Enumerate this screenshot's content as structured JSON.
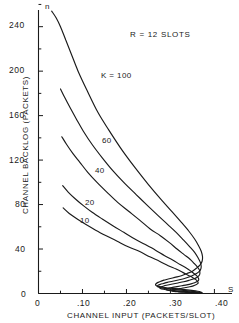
{
  "figure": {
    "background_color": "#ffffff",
    "ink_color": "#1a1a1a"
  },
  "annotation": {
    "text": "R = 12 SLOTS"
  },
  "axis_symbols": {
    "y_variable": "n",
    "x_variable": "S"
  },
  "axes": {
    "x_title": "CHANNEL INPUT (PACKETS/SLOT)",
    "y_title": "CHANNEL BACKLOG (PACKETS)",
    "x_ticks": [
      "0",
      ".10",
      ".20",
      ".30",
      ".40"
    ],
    "y_ticks": [
      "0",
      "40",
      "80",
      "120",
      "160",
      "200",
      "240"
    ]
  },
  "curve_labels": {
    "k100": "K = 100",
    "k60": "60",
    "k40": "40",
    "k20": "20",
    "k10": "10"
  },
  "chart_data": {
    "type": "line",
    "title": "",
    "subtitle": "",
    "annotation": "R = 12 SLOTS",
    "xlabel": "CHANNEL INPUT (PACKETS/SLOT)",
    "ylabel": "CHANNEL BACKLOG (PACKETS)",
    "x_symbol": "S",
    "y_symbol": "n",
    "xlim": [
      0,
      0.44
    ],
    "ylim": [
      0,
      255
    ],
    "xticks": [
      0,
      0.1,
      0.2,
      0.3,
      0.4
    ],
    "xticklabels": [
      "0",
      ".10",
      ".20",
      ".30",
      ".40"
    ],
    "yticks": [
      0,
      40,
      80,
      120,
      160,
      200,
      240
    ],
    "yticklabels": [
      "0",
      "40",
      "80",
      "120",
      "160",
      "200",
      "240"
    ],
    "minor_ticks": true,
    "grid": false,
    "legend": "inline-curve-labels",
    "legend_position": "on-curve",
    "series": [
      {
        "name": "K = 100",
        "label": "K = 100",
        "x": [
          0.03,
          0.04,
          0.05,
          0.062,
          0.075,
          0.09,
          0.11,
          0.135,
          0.16,
          0.19,
          0.22,
          0.25,
          0.28,
          0.305,
          0.325,
          0.342,
          0.355,
          0.364,
          0.37,
          0.373,
          0.372,
          0.368,
          0.36,
          0.35,
          0.338,
          0.325,
          0.31,
          0.295,
          0.285,
          0.278,
          0.272,
          0.268,
          0.266,
          0.268,
          0.275,
          0.288,
          0.305,
          0.322,
          0.338,
          0.352,
          0.362,
          0.369,
          0.372
        ],
        "y": [
          254,
          248,
          240,
          228,
          215,
          200,
          183,
          163,
          147,
          129,
          113,
          98,
          84,
          73,
          64,
          56,
          49,
          43,
          38,
          33,
          29,
          26,
          23,
          20,
          18,
          16,
          14.5,
          13,
          12,
          11,
          10,
          9,
          8,
          7,
          6.2,
          5.4,
          4.6,
          3.9,
          3.2,
          2.6,
          2.0,
          1.4,
          0.8
        ]
      },
      {
        "name": "60",
        "label": "60",
        "x": [
          0.05,
          0.06,
          0.072,
          0.086,
          0.102,
          0.122,
          0.145,
          0.17,
          0.196,
          0.222,
          0.248,
          0.272,
          0.294,
          0.313,
          0.33,
          0.344,
          0.355,
          0.363,
          0.368,
          0.37,
          0.368,
          0.363,
          0.355,
          0.344,
          0.332,
          0.318,
          0.305,
          0.293,
          0.284,
          0.277,
          0.272,
          0.27,
          0.272,
          0.28,
          0.294,
          0.312,
          0.33,
          0.346,
          0.359,
          0.368,
          0.371
        ],
        "y": [
          184,
          176,
          167,
          157,
          146,
          134,
          122,
          110,
          99,
          89,
          79,
          70,
          62,
          55,
          48,
          42,
          37,
          32,
          28,
          24,
          21,
          19,
          17,
          15,
          13.5,
          12.2,
          11,
          10,
          9,
          8.2,
          7.4,
          6.6,
          5.8,
          5.0,
          4.2,
          3.5,
          2.8,
          2.1,
          1.5,
          0.9,
          0.5
        ]
      },
      {
        "name": "40",
        "label": "40",
        "x": [
          0.053,
          0.064,
          0.078,
          0.094,
          0.112,
          0.133,
          0.156,
          0.18,
          0.205,
          0.23,
          0.254,
          0.277,
          0.297,
          0.315,
          0.331,
          0.344,
          0.354,
          0.361,
          0.366,
          0.367,
          0.365,
          0.36,
          0.352,
          0.342,
          0.33,
          0.317,
          0.305,
          0.294,
          0.285,
          0.279,
          0.276,
          0.277,
          0.284,
          0.296,
          0.312,
          0.33,
          0.346,
          0.359,
          0.367,
          0.37
        ],
        "y": [
          141,
          134,
          126,
          118,
          109,
          100,
          91,
          82,
          74,
          66,
          58,
          52,
          46,
          40,
          35,
          31,
          27,
          24,
          21,
          18,
          16,
          14.5,
          13,
          11.8,
          10.6,
          9.5,
          8.5,
          7.6,
          6.8,
          6.0,
          5.2,
          4.5,
          3.8,
          3.1,
          2.5,
          1.9,
          1.4,
          0.9,
          0.5,
          0.2
        ]
      },
      {
        "name": "20",
        "label": "20",
        "x": [
          0.055,
          0.068,
          0.084,
          0.102,
          0.122,
          0.145,
          0.169,
          0.194,
          0.219,
          0.243,
          0.266,
          0.287,
          0.306,
          0.322,
          0.336,
          0.347,
          0.355,
          0.361,
          0.364,
          0.364,
          0.361,
          0.355,
          0.347,
          0.337,
          0.326,
          0.315,
          0.305,
          0.297,
          0.292,
          0.29,
          0.293,
          0.302,
          0.315,
          0.331,
          0.346,
          0.358,
          0.366,
          0.369
        ],
        "y": [
          97,
          91,
          85,
          79,
          73,
          67,
          61,
          55,
          49,
          44,
          39,
          34,
          30,
          26,
          23,
          20,
          17.5,
          15.5,
          13.5,
          12,
          10.8,
          9.7,
          8.7,
          7.8,
          7.0,
          6.2,
          5.5,
          4.8,
          4.1,
          3.5,
          2.9,
          2.3,
          1.8,
          1.3,
          0.9,
          0.6,
          0.3,
          0.1
        ]
      },
      {
        "name": "10",
        "label": "10",
        "x": [
          0.056,
          0.07,
          0.088,
          0.108,
          0.13,
          0.154,
          0.179,
          0.204,
          0.229,
          0.253,
          0.275,
          0.295,
          0.313,
          0.328,
          0.34,
          0.35,
          0.357,
          0.361,
          0.363,
          0.362,
          0.358,
          0.352,
          0.344,
          0.335,
          0.326,
          0.317,
          0.31,
          0.305,
          0.304,
          0.308,
          0.318,
          0.332,
          0.346,
          0.357,
          0.365,
          0.368
        ],
        "y": [
          77,
          72,
          67,
          62,
          57,
          52,
          47,
          42,
          38,
          33,
          29,
          25,
          22,
          19,
          16.5,
          14.5,
          12.7,
          11.2,
          9.9,
          8.8,
          7.8,
          6.9,
          6.1,
          5.4,
          4.7,
          4.1,
          3.5,
          2.9,
          2.4,
          1.9,
          1.5,
          1.1,
          0.7,
          0.45,
          0.25,
          0.1
        ]
      }
    ]
  }
}
